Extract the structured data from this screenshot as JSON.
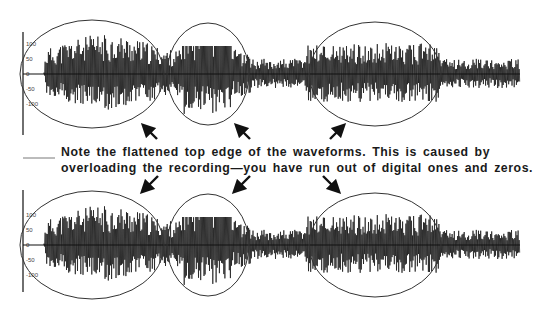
{
  "caption": {
    "line1": "Note the flattened top edge of the waveforms.  This is caused by",
    "line2": "overloading the recording—you have run out of digital ones and zeros."
  },
  "waveforms": [
    {
      "name": "top-waveform",
      "axis_ticks": [
        "100",
        "50",
        "0",
        "-50",
        "-100"
      ],
      "highlight_regions": 3
    },
    {
      "name": "bottom-waveform",
      "axis_ticks": [
        "100",
        "50",
        "0",
        "-50",
        "-100"
      ],
      "highlight_regions": 3
    }
  ],
  "arrows": {
    "top_row": [
      "up-left",
      "up-left",
      "up-right"
    ],
    "bottom_row": [
      "down-left",
      "down-left",
      "down-right"
    ]
  },
  "colors": {
    "ink": "#1a1a1a",
    "waveform": "#111111",
    "outline": "#333333"
  }
}
